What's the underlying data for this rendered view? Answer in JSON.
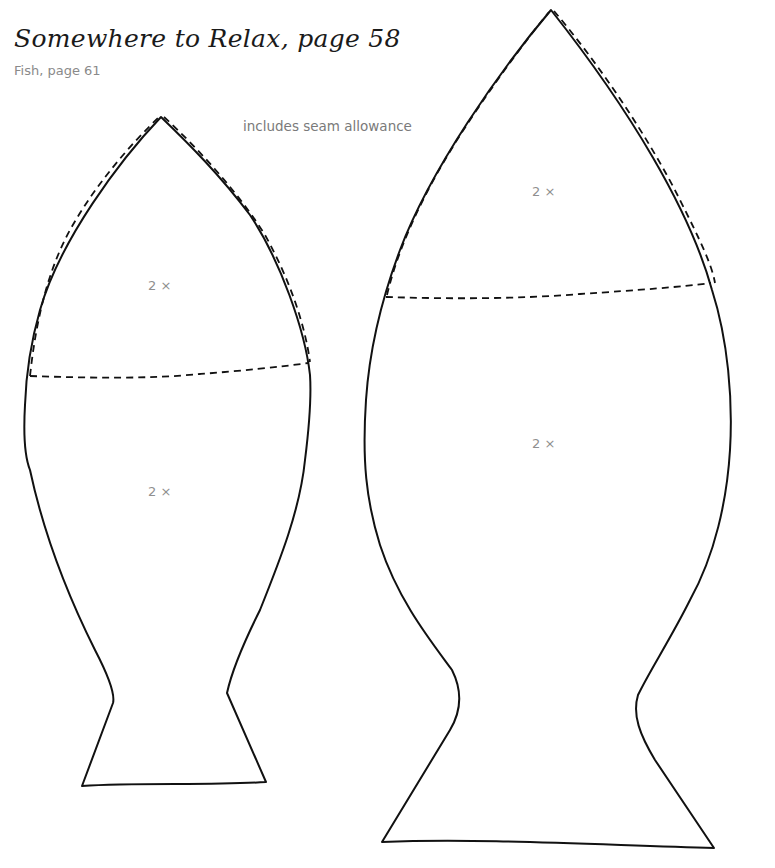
{
  "header": {
    "title": "Somewhere to Relax, page 58",
    "subtitle": "Fish, page 61"
  },
  "note": "includes seam allowance",
  "patterns": [
    {
      "name": "small-fish",
      "pieces": [
        {
          "part": "head",
          "quantity": "2 ×"
        },
        {
          "part": "body",
          "quantity": "2 ×"
        }
      ]
    },
    {
      "name": "large-fish",
      "pieces": [
        {
          "part": "head",
          "quantity": "2 ×"
        },
        {
          "part": "body",
          "quantity": "2 ×"
        }
      ]
    }
  ],
  "colors": {
    "outline": "#111111",
    "label": "#8f8f8f",
    "background": "#ffffff"
  }
}
